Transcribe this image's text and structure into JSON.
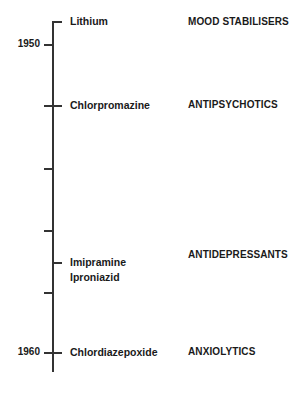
{
  "timeline": {
    "years": [
      {
        "label": "1950",
        "y": 44
      },
      {
        "label": "1960",
        "y": 352
      }
    ],
    "minor_ticks": [
      168,
      230,
      292
    ],
    "entries": [
      {
        "drugs": [
          "Lithium"
        ],
        "class": "MOOD STABILISERS",
        "y": 22
      },
      {
        "drugs": [
          "Chlorpromazine"
        ],
        "class": "ANTIPSYCHOTICS",
        "y": 105
      },
      {
        "drugs": [
          "Imipramine",
          "Iproniazid"
        ],
        "class": "ANTIDEPRESSANTS",
        "y": 262
      },
      {
        "drugs": [
          "Chlordiazepoxide"
        ],
        "class": "ANXIOLYTICS",
        "y": 352
      }
    ]
  }
}
